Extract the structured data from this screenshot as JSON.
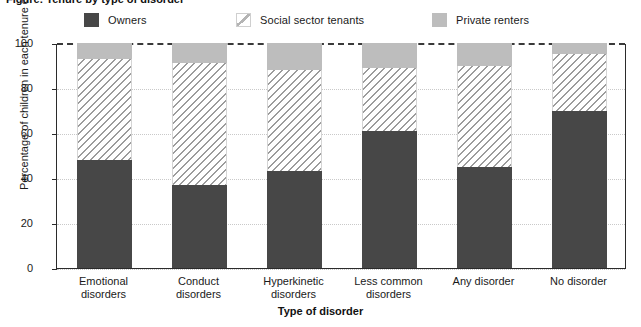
{
  "title_sliver": "Figure: Tenure by type of disorder",
  "legend": {
    "items": [
      {
        "label": "Owners",
        "key": "owners",
        "color": "#474747"
      },
      {
        "label": "Social sector tenants",
        "key": "social",
        "color": "#ffffff"
      },
      {
        "label": "Private renters",
        "key": "private",
        "color": "#bdbdbd"
      }
    ]
  },
  "axes": {
    "y_title": "Percentage of children in each tenure category",
    "x_title": "Type of disorder",
    "y_ticks": [
      "0",
      "20",
      "40",
      "60",
      "80",
      "100"
    ]
  },
  "chart_data": {
    "type": "bar",
    "stacked": true,
    "title": "",
    "xlabel": "Type of disorder",
    "ylabel": "Percentage of children in each tenure category",
    "ylim": [
      0,
      100
    ],
    "yticks": [
      0,
      20,
      40,
      60,
      80,
      100
    ],
    "grid": true,
    "legend_position": "top",
    "categories": [
      "Emotional disorders",
      "Conduct disorders",
      "Hyperkinetic disorders",
      "Less common disorders",
      "Any disorder",
      "No disorder"
    ],
    "category_lines": [
      [
        "Emotional",
        "disorders"
      ],
      [
        "Conduct",
        "disorders"
      ],
      [
        "Hyperkinetic",
        "disorders"
      ],
      [
        "Less common",
        "disorders"
      ],
      [
        "Any disorder",
        ""
      ],
      [
        "No disorder",
        ""
      ]
    ],
    "series": [
      {
        "name": "Owners",
        "values": [
          48,
          37,
          43,
          61,
          45,
          70
        ]
      },
      {
        "name": "Social sector tenants",
        "values": [
          45,
          54,
          45,
          28,
          45,
          25
        ]
      },
      {
        "name": "Private renters",
        "values": [
          7,
          9,
          12,
          11,
          10,
          5
        ]
      }
    ]
  }
}
